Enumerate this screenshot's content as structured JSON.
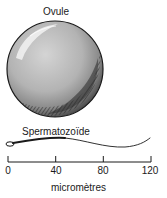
{
  "title": "Ovule",
  "ovule": {
    "label": "Ovule",
    "diameter_um": 100
  },
  "spermatozoid": {
    "label": "Spermatozoïde",
    "length_um": 120
  },
  "scale": {
    "unit_label": "micromètres",
    "ticks": [
      "0",
      "40",
      "80",
      "120"
    ],
    "min": 0,
    "max": 120
  },
  "colors": {
    "ink": "#1a1a1a",
    "sphere_fill": "#b5b5b5",
    "sphere_shadow": "#3a3a3a",
    "highlight": "#e8e8e8"
  }
}
